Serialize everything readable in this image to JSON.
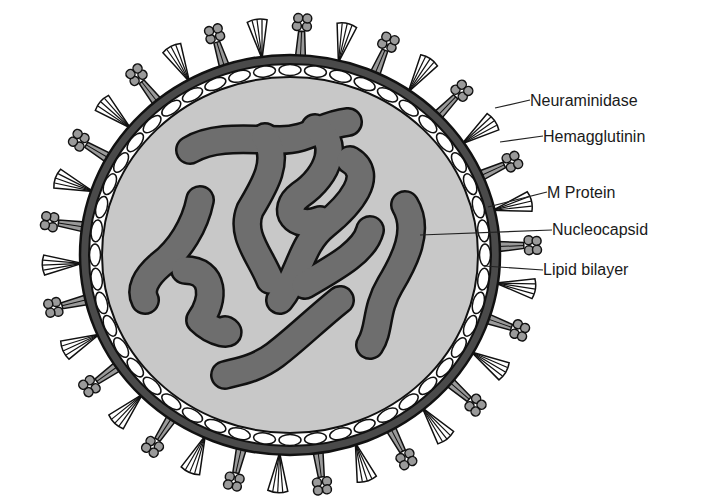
{
  "diagram": {
    "labels": [
      {
        "id": "neuraminidase",
        "text": "Neuraminidase",
        "x": 530,
        "y": 92
      },
      {
        "id": "hemagglutinin",
        "text": "Hemagglutinin",
        "x": 543,
        "y": 128
      },
      {
        "id": "m-protein",
        "text": "M Protein",
        "x": 547,
        "y": 184
      },
      {
        "id": "nucleocapsid",
        "text": "Nucleocapsid",
        "x": 552,
        "y": 221
      },
      {
        "id": "lipid-bilayer",
        "text": "Lipid bilayer",
        "x": 543,
        "y": 261
      }
    ],
    "colors": {
      "background": "#ffffff",
      "interior": "#c8c8c8",
      "nucleocapsid": "#6e6e6e",
      "membrane": "#4a4a4a",
      "outline": "#111111",
      "spike_fill": "#9a9a9a",
      "lipid_beads": "#ffffff"
    }
  }
}
